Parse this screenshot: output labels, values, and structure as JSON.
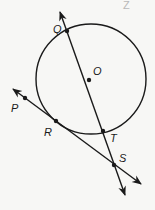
{
  "diagram": {
    "type": "geometry",
    "stroke_color": "#1a1a1a",
    "background_color": "#f7f7f5",
    "corner_label": "Z",
    "circle": {
      "name": "circle-O",
      "cx": 91,
      "cy": 79,
      "r": 55
    },
    "points": [
      {
        "id": "Q",
        "label": "Q",
        "x": 67,
        "y": 31,
        "label_x": 53,
        "label_y": 33
      },
      {
        "id": "O",
        "label": "O",
        "x": 89,
        "y": 80,
        "label_x": 93,
        "label_y": 75
      },
      {
        "id": "P",
        "label": "P",
        "x": 25,
        "y": 98,
        "label_x": 11,
        "label_y": 112
      },
      {
        "id": "R",
        "label": "R",
        "x": 56,
        "y": 121,
        "label_x": 44,
        "label_y": 136
      },
      {
        "id": "T",
        "label": "T",
        "x": 103,
        "y": 131,
        "label_x": 110,
        "label_y": 142
      },
      {
        "id": "S",
        "label": "S",
        "x": 114,
        "y": 165,
        "label_x": 119,
        "label_y": 162
      }
    ],
    "lines": [
      {
        "name": "line-QS",
        "through": [
          "Q",
          "T",
          "S"
        ],
        "x1": 60,
        "y1": 12,
        "x2": 125,
        "y2": 195
      },
      {
        "name": "line-PS",
        "through": [
          "P",
          "R",
          "S"
        ],
        "x1": 13,
        "y1": 89,
        "x2": 141,
        "y2": 184
      }
    ]
  }
}
